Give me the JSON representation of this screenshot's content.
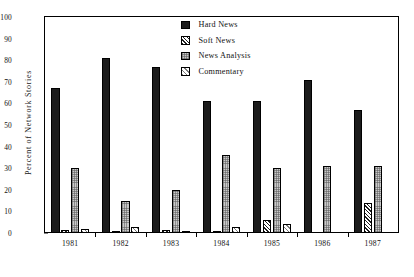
{
  "chart_data": {
    "type": "bar",
    "title": "",
    "xlabel": "",
    "ylabel": "Percent of Network Stories",
    "ylim": [
      0,
      100
    ],
    "ytick_step": 10,
    "grid": false,
    "legend_position": "top-center",
    "categories": [
      "1981",
      "1982",
      "1983",
      "1984",
      "1985",
      "1986",
      "1987"
    ],
    "series": [
      {
        "name": "Hard News",
        "pattern": "solid-black",
        "values": [
          67,
          81,
          77,
          61,
          61,
          71,
          57
        ]
      },
      {
        "name": "Soft News",
        "pattern": "dense-diagonal-hatch",
        "values": [
          1.5,
          1,
          1.5,
          0.5,
          6,
          0,
          14
        ]
      },
      {
        "name": "News Analysis",
        "pattern": "gray-stipple",
        "values": [
          30,
          15,
          20,
          36,
          30,
          31,
          31
        ]
      },
      {
        "name": "Commentary",
        "pattern": "light-diagonal-hatch",
        "values": [
          2,
          3,
          1,
          3,
          4,
          0,
          0
        ]
      }
    ],
    "yticks": [
      "0",
      "10",
      "20",
      "30",
      "40",
      "50",
      "60",
      "70",
      "80",
      "90",
      "100"
    ]
  },
  "legend": {
    "items": [
      {
        "label": "Hard News"
      },
      {
        "label": "Soft News"
      },
      {
        "label": "News Analysis"
      },
      {
        "label": "Commentary"
      }
    ]
  }
}
